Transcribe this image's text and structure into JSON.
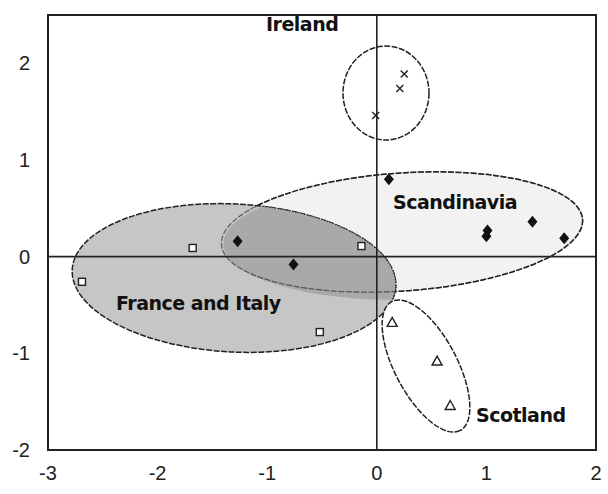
{
  "chart_data": {
    "type": "scatter",
    "title": "",
    "xlabel": "",
    "ylabel": "",
    "xlim": [
      -3,
      2
    ],
    "ylim": [
      -2,
      2.5
    ],
    "xticks": [
      -3,
      -2,
      -1,
      0,
      1,
      2
    ],
    "yticks": [
      -2,
      -1,
      0,
      1,
      2
    ],
    "grid": false,
    "reference_lines": {
      "x": 0,
      "y": 0
    },
    "groups": [
      {
        "name": "Ireland",
        "marker": "x",
        "fill": "none",
        "points": [
          {
            "x": 0.25,
            "y": 1.89
          },
          {
            "x": 0.21,
            "y": 1.74
          },
          {
            "x": -0.01,
            "y": 1.46
          }
        ]
      },
      {
        "name": "Scandinavia",
        "marker": "diamond",
        "fill": "#f2f2f2",
        "points": [
          {
            "x": 0.11,
            "y": 0.8
          },
          {
            "x": -1.27,
            "y": 0.16
          },
          {
            "x": -0.76,
            "y": -0.08
          },
          {
            "x": 1.01,
            "y": 0.27
          },
          {
            "x": 1.0,
            "y": 0.21
          },
          {
            "x": 1.42,
            "y": 0.36
          },
          {
            "x": 1.71,
            "y": 0.19
          }
        ]
      },
      {
        "name": "France and Italy",
        "marker": "square",
        "fill": "#c6c6c6",
        "points": [
          {
            "x": -1.68,
            "y": 0.09
          },
          {
            "x": -0.14,
            "y": 0.11
          },
          {
            "x": -2.69,
            "y": -0.26
          },
          {
            "x": -0.52,
            "y": -0.78
          }
        ]
      },
      {
        "name": "Scotland",
        "marker": "triangle",
        "fill": "none",
        "points": [
          {
            "x": 0.14,
            "y": -0.68
          },
          {
            "x": 0.55,
            "y": -1.08
          },
          {
            "x": 0.67,
            "y": -1.54
          }
        ]
      }
    ],
    "annotations": [
      {
        "text": "Ireland",
        "x": -1.0,
        "y": 2.35
      },
      {
        "text": "Scandinavia",
        "x": 0.15,
        "y": 0.5
      },
      {
        "text": "France and Italy",
        "x": -2.4,
        "y": -0.52
      },
      {
        "text": "Scotland",
        "x": 0.92,
        "y": -1.68
      }
    ],
    "overlap_fill": "#a9a9a9"
  }
}
